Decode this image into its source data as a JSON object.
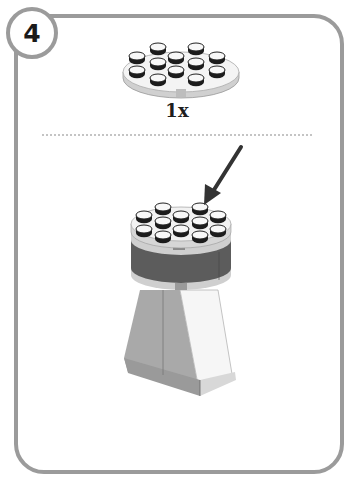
{
  "step": {
    "number": "4",
    "parts_callout": {
      "part": "round-plate-4x4-white",
      "quantity_label": "1x"
    },
    "assembly": {
      "description": "round white 4x4 plate placed on top of dark gray cylinder tower on a light gray tapered base",
      "arrow": "placement-arrow"
    }
  },
  "colors": {
    "frame": "#9b9b9b",
    "plate_white": "#f2f2f2",
    "stud_black": "#1c1c1c",
    "cylinder_dark": "#5a5a5a",
    "base_gray": "#a8a8a8",
    "base_white": "#f6f6f6"
  }
}
